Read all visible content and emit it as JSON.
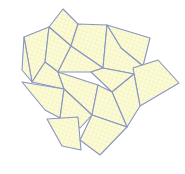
{
  "diagram": {
    "type": "polygon-tiling",
    "width": 185,
    "height": 174,
    "colors": {
      "background": "#ffffff",
      "fill": "#fbfbdc",
      "hatch": "#efe98a",
      "stroke": "#8a94c2"
    },
    "polygons": [
      {
        "id": "p1",
        "points": "63,9 78,24 71,46 49,27"
      },
      {
        "id": "p2",
        "points": "24,37 49,27 45,62 32,82"
      },
      {
        "id": "p3",
        "points": "49,27 71,46 58,72 45,62"
      },
      {
        "id": "p4",
        "points": "78,24 107,25 103,68 71,46"
      },
      {
        "id": "p5",
        "points": "107,25 150,38 143,66 121,48"
      },
      {
        "id": "p6",
        "points": "107,25 121,48 143,66 134,74 103,68"
      },
      {
        "id": "p7",
        "points": "71,46 103,68 91,72 58,72"
      },
      {
        "id": "p8",
        "points": "91,72 103,68 134,74 112,92"
      },
      {
        "id": "p9",
        "points": "24,37 32,82 22,70"
      },
      {
        "id": "p10",
        "points": "45,62 58,72 64,89 32,82"
      },
      {
        "id": "p11",
        "points": "158,60 179,83 140,106 133,68"
      },
      {
        "id": "p12",
        "points": "134,74 140,106 127,127 112,92"
      },
      {
        "id": "p13",
        "points": "58,72 98,85 92,115 64,89"
      },
      {
        "id": "p14",
        "points": "22,82 64,89 60,118 45,110"
      },
      {
        "id": "p15",
        "points": "64,89 92,115 80,128 60,118"
      },
      {
        "id": "p16",
        "points": "98,85 112,92 127,127 92,115"
      },
      {
        "id": "p17",
        "points": "47,119 78,117 81,150 62,146"
      },
      {
        "id": "p18",
        "points": "92,115 127,127 100,155 80,140"
      }
    ]
  }
}
